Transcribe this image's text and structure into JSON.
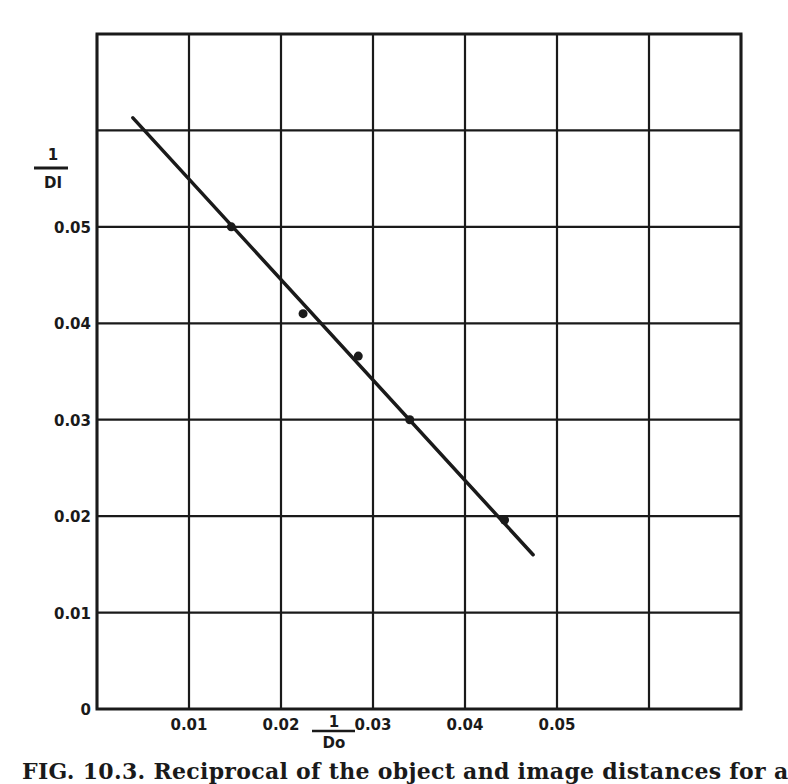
{
  "chart_data": {
    "type": "scatter",
    "title": "",
    "caption": "FIG. 10.3. Reciprocal of the object and image distances for a",
    "xlabel": {
      "numerator": "1",
      "denominator": "Do"
    },
    "ylabel": {
      "numerator": "1",
      "denominator": "DI"
    },
    "xlim": [
      0,
      0.07
    ],
    "ylim": [
      0,
      0.07
    ],
    "grid": true,
    "x_ticks": [
      0,
      0.01,
      0.02,
      0.03,
      0.04,
      0.05,
      0.06,
      0.07
    ],
    "x_tick_labels": [
      "0.01",
      "0.02",
      "0.03",
      "0.04",
      "0.05"
    ],
    "y_ticks": [
      0,
      0.01,
      0.02,
      0.03,
      0.04,
      0.05,
      0.06,
      0.07
    ],
    "y_tick_labels": [
      "0",
      "0.01",
      "0.02",
      "0.03",
      "0.04",
      "0.05"
    ],
    "series": [
      {
        "name": "measured points",
        "kind": "scatter",
        "x": [
          0.0146,
          0.0224,
          0.0284,
          0.034,
          0.0443
        ],
        "y": [
          0.05,
          0.041,
          0.0366,
          0.03,
          0.0196
        ]
      },
      {
        "name": "fitted line",
        "kind": "line",
        "x": [
          0.0039,
          0.0474
        ],
        "y": [
          0.0613,
          0.016
        ]
      }
    ],
    "colors": {
      "ink": "#1a1a1a",
      "background": "#ffffff"
    }
  }
}
